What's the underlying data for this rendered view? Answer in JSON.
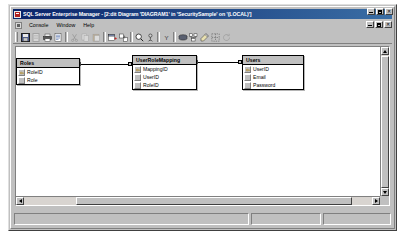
{
  "window": {
    "title": "SQL Server Enterprise Manager - [2:dit Diagram 'DIAGRAM1' in 'SecuritySample' on '(LOCAL)']",
    "app_icon": "sql-server-icon",
    "controls": {
      "minimize": "_",
      "maximize": "□",
      "close": "✕"
    },
    "mdi_controls": {
      "restore_down": "_",
      "maximize": "□",
      "close": "✕"
    }
  },
  "menubar": {
    "system_icon": "console-icon",
    "items": [
      {
        "label": "Console",
        "accel": "C"
      },
      {
        "label": "Window",
        "accel": "W"
      },
      {
        "label": "Help",
        "accel": "H"
      }
    ]
  },
  "toolbar": {
    "buttons": [
      {
        "name": "save-button",
        "icon": "floppy-disk-icon",
        "enabled": true
      },
      {
        "name": "new-table-button",
        "icon": "new-table-icon",
        "enabled": false
      },
      {
        "name": "print-button",
        "icon": "printer-icon",
        "enabled": true
      },
      {
        "name": "properties-button",
        "icon": "properties-icon",
        "enabled": true
      },
      {
        "name": "cut-button",
        "icon": "scissors-icon",
        "enabled": false
      },
      {
        "name": "copy-button",
        "icon": "copy-icon",
        "enabled": false
      },
      {
        "name": "paste-button",
        "icon": "clipboard-icon",
        "enabled": false
      },
      {
        "name": "add-table-button",
        "icon": "add-table-icon",
        "enabled": true
      },
      {
        "name": "add-related-button",
        "icon": "add-related-icon",
        "enabled": true
      },
      {
        "name": "zoom-button",
        "icon": "magnifier-icon",
        "enabled": true
      },
      {
        "name": "relationships-button",
        "icon": "relationships-icon",
        "enabled": true
      },
      {
        "name": "show-sql-button",
        "icon": "sql-pane-icon",
        "enabled": true
      },
      {
        "name": "database-button",
        "icon": "database-icon",
        "enabled": true
      },
      {
        "name": "arrange-tables-button",
        "icon": "arrange-tables-icon",
        "enabled": true
      },
      {
        "name": "annotation-button",
        "icon": "annotation-icon",
        "enabled": true
      },
      {
        "name": "page-breaks-button",
        "icon": "page-breaks-icon",
        "enabled": true
      },
      {
        "name": "recalc-button",
        "icon": "recalculate-icon",
        "enabled": false
      }
    ]
  },
  "statusbar": {
    "panels": [
      "",
      "",
      ""
    ]
  },
  "scrollbars": {
    "vertical": {
      "up_arrow": "▲",
      "down_arrow": "▼"
    },
    "horizontal": {
      "left_arrow": "◄",
      "right_arrow": "►"
    }
  },
  "diagram": {
    "name": "DIAGRAM1",
    "tables": [
      {
        "name": "Roles",
        "left": 44,
        "top": 91,
        "width": 64,
        "columns": [
          {
            "name": "RoleID",
            "primary_key": true
          },
          {
            "name": "Role",
            "primary_key": false
          }
        ]
      },
      {
        "name": "UserRoleMapping",
        "left": 160,
        "top": 88,
        "width": 65,
        "columns": [
          {
            "name": "MappingID",
            "primary_key": true
          },
          {
            "name": "UserID",
            "primary_key": false
          },
          {
            "name": "RoleID",
            "primary_key": false
          }
        ]
      },
      {
        "name": "Users",
        "left": 270,
        "top": 88,
        "width": 62,
        "columns": [
          {
            "name": "UserID",
            "primary_key": true
          },
          {
            "name": "Email",
            "primary_key": false
          },
          {
            "name": "Password",
            "primary_key": false
          }
        ]
      }
    ],
    "relationships": [
      {
        "from": "Roles",
        "to": "UserRoleMapping",
        "x1": 108,
        "x2": 160,
        "y": 97
      },
      {
        "from": "UserRoleMapping",
        "to": "Users",
        "x1": 225,
        "x2": 270,
        "y": 95
      }
    ]
  },
  "colors": {
    "titlebar_start": "#0a246a",
    "titlebar_end": "#3a6ea5",
    "face": "#c0c0c0",
    "canvas": "#ffffff",
    "table_header": "#c0c0c0",
    "border": "#000000"
  }
}
